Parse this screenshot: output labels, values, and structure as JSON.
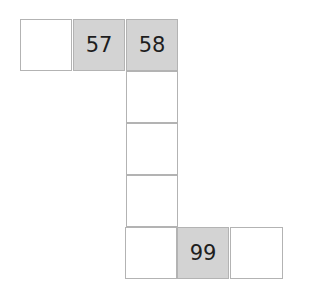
{
  "grid": {
    "cells": [
      {
        "label": "",
        "shaded": false
      },
      {
        "label": "57",
        "shaded": true
      },
      {
        "label": "58",
        "shaded": true
      },
      {
        "label": "",
        "shaded": false
      },
      {
        "label": "",
        "shaded": false
      },
      {
        "label": "",
        "shaded": false
      },
      {
        "label": "",
        "shaded": false
      },
      {
        "label": "99",
        "shaded": true
      },
      {
        "label": "",
        "shaded": false
      }
    ]
  },
  "colors": {
    "shaded": "#d3d3d3",
    "border": "#b3b3b3",
    "text": "#1e1e1e"
  }
}
